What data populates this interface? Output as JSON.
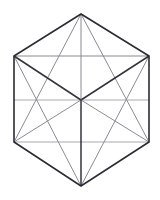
{
  "figure": {
    "shape_name": "hexagon",
    "background_color": "#ffffff",
    "outline_color": "#2b2b33",
    "heavy_line_color": "#33333b",
    "light_line_color": "#8b8b93",
    "faint_line_color": "#a9a9b0",
    "canvas": {
      "width": 160,
      "height": 200
    },
    "vertices": {
      "top": {
        "label": "top",
        "x": 81,
        "y": 14
      },
      "upper_left": {
        "label": "upper-left",
        "x": 14,
        "y": 56
      },
      "upper_right": {
        "label": "upper-right",
        "x": 149,
        "y": 56
      },
      "lower_left": {
        "label": "lower-left",
        "x": 14,
        "y": 142
      },
      "lower_right": {
        "label": "lower-right",
        "x": 149,
        "y": 142
      },
      "bottom": {
        "label": "bottom",
        "x": 81,
        "y": 186
      },
      "center": {
        "label": "center",
        "x": 81,
        "y": 100
      }
    },
    "outline_path": "M 81 14 L 149 56 L 149 142 L 81 186 L 14 142 L 14 56 Z",
    "edges": [
      {
        "name": "edge-top-right",
        "x1": 81,
        "y1": 14,
        "x2": 149,
        "y2": 56
      },
      {
        "name": "edge-right",
        "x1": 149,
        "y1": 56,
        "x2": 149,
        "y2": 142
      },
      {
        "name": "edge-bottom-right",
        "x1": 149,
        "y1": 142,
        "x2": 81,
        "y2": 186
      },
      {
        "name": "edge-bottom-left",
        "x1": 81,
        "y1": 186,
        "x2": 14,
        "y2": 142
      },
      {
        "name": "edge-left",
        "x1": 14,
        "y1": 142,
        "x2": 14,
        "y2": 56
      },
      {
        "name": "edge-top-left",
        "x1": 14,
        "y1": 56,
        "x2": 81,
        "y2": 14
      }
    ],
    "chords": [
      {
        "name": "chord-upper-horizontal",
        "x1": 14,
        "y1": 56,
        "x2": 149,
        "y2": 56,
        "weight": "light"
      },
      {
        "name": "chord-middle-horizontal",
        "x1": 14,
        "y1": 100,
        "x2": 149,
        "y2": 100,
        "weight": "faint"
      },
      {
        "name": "chord-lower-horizontal",
        "x1": 14,
        "y1": 142,
        "x2": 149,
        "y2": 142,
        "weight": "faint"
      }
    ],
    "spokes": [
      {
        "name": "spoke-center-to-top",
        "x1": 81,
        "y1": 100,
        "x2": 81,
        "y2": 14,
        "weight": "light"
      },
      {
        "name": "spoke-center-to-upper-left",
        "x1": 81,
        "y1": 100,
        "x2": 14,
        "y2": 56,
        "weight": "heavy"
      },
      {
        "name": "spoke-center-to-upper-right",
        "x1": 81,
        "y1": 100,
        "x2": 149,
        "y2": 56,
        "weight": "heavy"
      },
      {
        "name": "spoke-center-to-lower-left",
        "x1": 81,
        "y1": 100,
        "x2": 14,
        "y2": 142,
        "weight": "light"
      },
      {
        "name": "spoke-center-to-lower-right",
        "x1": 81,
        "y1": 100,
        "x2": 149,
        "y2": 142,
        "weight": "light"
      },
      {
        "name": "spoke-center-to-bottom",
        "x1": 81,
        "y1": 100,
        "x2": 81,
        "y2": 186,
        "weight": "heavy"
      }
    ],
    "diagonals": [
      {
        "name": "diagonal-top-to-lower-left",
        "x1": 81,
        "y1": 14,
        "x2": 14,
        "y2": 142,
        "weight": "light"
      },
      {
        "name": "diagonal-top-to-lower-right",
        "x1": 81,
        "y1": 14,
        "x2": 149,
        "y2": 142,
        "weight": "light"
      },
      {
        "name": "diagonal-bottom-to-upper-left",
        "x1": 81,
        "y1": 186,
        "x2": 14,
        "y2": 56,
        "weight": "light"
      },
      {
        "name": "diagonal-bottom-to-upper-right",
        "x1": 81,
        "y1": 186,
        "x2": 149,
        "y2": 56,
        "weight": "light"
      }
    ]
  }
}
